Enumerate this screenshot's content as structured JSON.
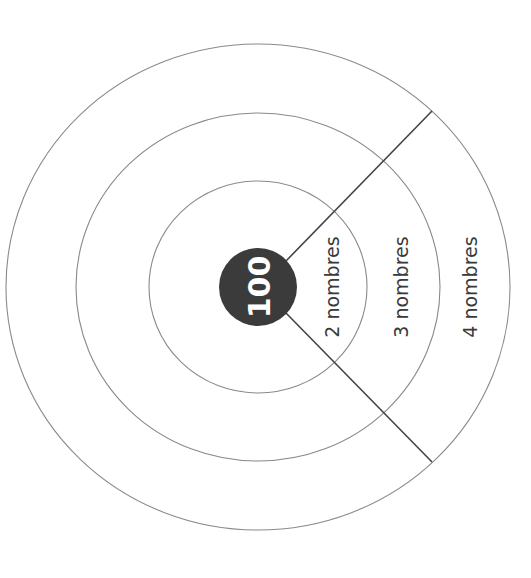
{
  "diagram": {
    "type": "concentric-target",
    "center": {
      "label": "100",
      "color": "#3b3b3b",
      "text_color": "#ffffff"
    },
    "rings": [
      {
        "label": "2 nombres"
      },
      {
        "label": "3 nombres"
      },
      {
        "label": "4 nombres"
      }
    ],
    "colors": {
      "ring_stroke": "#8a8a8a",
      "divider_stroke": "#444444",
      "background": "#ffffff"
    }
  }
}
